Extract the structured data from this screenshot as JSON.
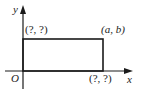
{
  "diagram": {
    "type": "coordinate-plane-rectangle",
    "axes": {
      "x_label": "x",
      "y_label": "y",
      "origin_label": "O"
    },
    "rectangle": {
      "vertices": {
        "origin": "O",
        "top_left": "(?, ?)",
        "top_right": "(a, b)",
        "bottom_right": "(?, ?)"
      }
    },
    "labels": {
      "top_left": "(?, ?)",
      "top_right": "(a, b)",
      "bottom_right": "(?, ?)",
      "origin": "O",
      "x_axis": "x",
      "y_axis": "y"
    },
    "colors": {
      "line": "#1a1a1a",
      "background": "#ffffff"
    }
  }
}
